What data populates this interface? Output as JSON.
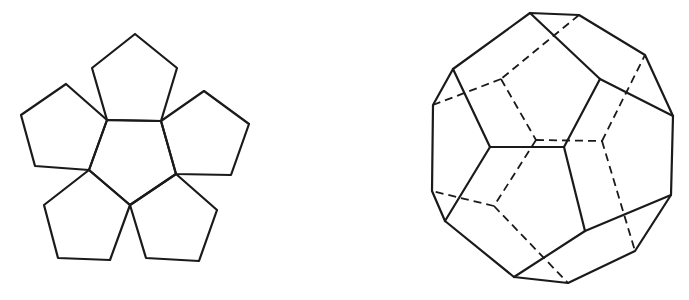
{
  "figures": [
    {
      "id": "dodecahedron-half-net",
      "description": "Planar net: central regular pentagon with five pentagons attached to its edges",
      "stroke_color": "#1a1a1a",
      "polygons": [
        {
          "name": "center",
          "points": [
            [
              107,
              120
            ],
            [
              161,
              121
            ],
            [
              176,
              174
            ],
            [
              130,
              205
            ],
            [
              89,
              170
            ]
          ]
        },
        {
          "name": "top",
          "points": [
            [
              135,
              34
            ],
            [
              92,
              68
            ],
            [
              107,
              120
            ],
            [
              161,
              121
            ],
            [
              177,
              68
            ]
          ]
        },
        {
          "name": "left",
          "points": [
            [
              66,
              84
            ],
            [
              21,
              115
            ],
            [
              35,
              166
            ],
            [
              89,
              170
            ],
            [
              107,
              120
            ]
          ]
        },
        {
          "name": "right",
          "points": [
            [
              204,
              91
            ],
            [
              249,
              124
            ],
            [
              231,
              175
            ],
            [
              176,
              174
            ],
            [
              161,
              121
            ]
          ]
        },
        {
          "name": "bottom-left",
          "points": [
            [
              89,
              170
            ],
            [
              44,
              205
            ],
            [
              58,
              258
            ],
            [
              110,
              260
            ],
            [
              130,
              205
            ]
          ]
        },
        {
          "name": "bottom-right",
          "points": [
            [
              176,
              174
            ],
            [
              217,
              210
            ],
            [
              199,
              261
            ],
            [
              146,
              258
            ],
            [
              130,
              205
            ]
          ]
        }
      ]
    },
    {
      "id": "dodecahedron-3d",
      "description": "Wireframe dodecahedron with hidden edges dashed",
      "stroke_color": "#1a1a1a",
      "outline": [
        [
          530,
          13
        ],
        [
          579,
          15
        ],
        [
          645,
          55
        ],
        [
          673,
          116
        ],
        [
          671,
          195
        ],
        [
          635,
          251
        ],
        [
          568,
          283
        ],
        [
          514,
          277
        ],
        [
          445,
          221
        ],
        [
          432,
          191
        ],
        [
          433,
          105
        ],
        [
          453,
          69
        ]
      ],
      "solid_edges": [
        [
          [
            530,
            13
          ],
          [
            600,
            79
          ]
        ],
        [
          [
            600,
            79
          ],
          [
            673,
            116
          ]
        ],
        [
          [
            600,
            79
          ],
          [
            564,
            147
          ]
        ],
        [
          [
            564,
            147
          ],
          [
            490,
            147
          ]
        ],
        [
          [
            490,
            147
          ],
          [
            453,
            69
          ]
        ],
        [
          [
            490,
            147
          ],
          [
            445,
            221
          ]
        ],
        [
          [
            564,
            147
          ],
          [
            585,
            231
          ]
        ],
        [
          [
            585,
            231
          ],
          [
            671,
            195
          ]
        ],
        [
          [
            585,
            231
          ],
          [
            514,
            277
          ]
        ]
      ],
      "dashed_edges": [
        [
          [
            579,
            15
          ],
          [
            501,
            79
          ]
        ],
        [
          [
            501,
            79
          ],
          [
            433,
            105
          ]
        ],
        [
          [
            501,
            79
          ],
          [
            536,
            140
          ]
        ],
        [
          [
            536,
            140
          ],
          [
            602,
            141
          ]
        ],
        [
          [
            602,
            141
          ],
          [
            645,
            55
          ]
        ],
        [
          [
            602,
            141
          ],
          [
            635,
            251
          ]
        ],
        [
          [
            536,
            140
          ],
          [
            494,
            206
          ]
        ],
        [
          [
            494,
            206
          ],
          [
            432,
            191
          ]
        ],
        [
          [
            494,
            206
          ],
          [
            568,
            283
          ]
        ]
      ]
    }
  ]
}
